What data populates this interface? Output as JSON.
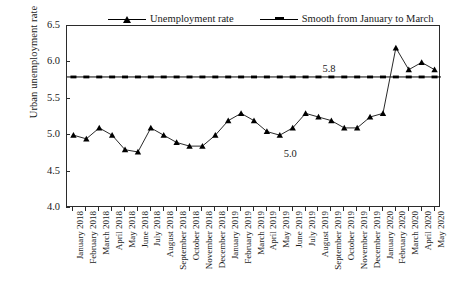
{
  "chart_data": {
    "type": "line",
    "title": "",
    "xlabel": "",
    "ylabel": "Urban unemployment rate（%）",
    "ylim": [
      4.0,
      6.5
    ],
    "ytick_labels": [
      "4.0",
      "4.5",
      "5.0",
      "5.5",
      "6.0",
      "6.5"
    ],
    "ytick_values": [
      4.0,
      4.5,
      5.0,
      5.5,
      6.0,
      6.5
    ],
    "grid": false,
    "legend_position": "top",
    "categories": [
      "January 2018",
      "February 2018",
      "March 2018",
      "April 2018",
      "May 2018",
      "June 2018",
      "July 2018",
      "August 2018",
      "September 2018",
      "October 2018",
      "November 2018",
      "December 2018",
      "January 2019",
      "February 2019",
      "March 2019",
      "April 2019",
      "May 2019",
      "June 2019",
      "July 2019",
      "August 2019",
      "September 2019",
      "October 2019",
      "November 2019",
      "December 2019",
      "January 2020",
      "February 2020",
      "March 2020",
      "April 2020",
      "May 2020"
    ],
    "series": [
      {
        "name": "Unemployment rate",
        "marker": "triangle",
        "values": [
          5.0,
          4.95,
          5.1,
          5.0,
          4.8,
          4.77,
          5.1,
          5.0,
          4.9,
          4.85,
          4.85,
          5.0,
          5.2,
          5.3,
          5.2,
          5.05,
          5.0,
          5.1,
          5.3,
          5.25,
          5.2,
          5.1,
          5.1,
          5.25,
          5.3,
          6.2,
          5.9,
          6.0,
          5.9
        ]
      },
      {
        "name": "Smooth from January to March",
        "marker": "line",
        "constant_value": 5.8
      }
    ],
    "annotations": [
      {
        "text": "5.8",
        "x_category": "September 2019",
        "y_value": 5.88
      },
      {
        "text": "5.0",
        "x_category": "June 2019",
        "y_value": 4.72
      }
    ]
  },
  "legend": {
    "entries": [
      {
        "label": "Unemployment rate"
      },
      {
        "label": "Smooth from January to March"
      }
    ]
  },
  "axis": {
    "y_title": "Urban unemployment rate（%）"
  }
}
